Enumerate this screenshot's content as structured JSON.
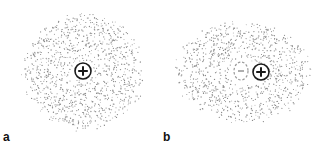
{
  "panels": [
    {
      "label": "a",
      "description": "Symmetric electron cloud around positive nucleus",
      "cloud": {
        "cx": 84,
        "cy": 71,
        "rx": 63,
        "ry": 61,
        "dots": 1100,
        "hole": 10,
        "seed": 7
      },
      "positive": {
        "cx": 83,
        "cy": 71,
        "r": 8,
        "symbol": "+"
      },
      "negative": null
    },
    {
      "label": "b",
      "description": "Polarized electron cloud; negative charge center shifted from positive nucleus",
      "cloud": {
        "cx": 243,
        "cy": 72,
        "rx": 71,
        "ry": 53,
        "dots": 1000,
        "hole": 14,
        "seed": 19
      },
      "positive": {
        "cx": 261,
        "cy": 72,
        "r": 8,
        "symbol": "+"
      },
      "negative": {
        "cx": 241,
        "cy": 71,
        "rx": 7,
        "ry": 9,
        "symbol": "−"
      }
    }
  ],
  "colors": {
    "dots": "#8a8a8a",
    "charge": "#1a1a1a",
    "negative": "#9a9a9a",
    "background": "#ffffff"
  }
}
